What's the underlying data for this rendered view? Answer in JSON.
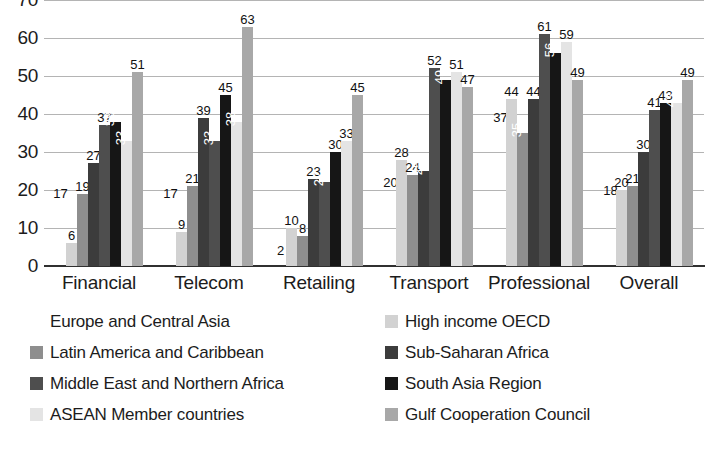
{
  "chart_data": {
    "type": "bar",
    "title": "",
    "subtitle": "",
    "xlabel": "",
    "ylabel": "",
    "ylim": [
      0,
      70
    ],
    "yticks": [
      0,
      10,
      20,
      30,
      40,
      50,
      60,
      70
    ],
    "ytick_labels": [
      "0",
      "10",
      "20",
      "30",
      "40",
      "50",
      "60",
      "70"
    ],
    "grid": true,
    "legend_position": "bottom",
    "categories": [
      "Financial",
      "Telecom",
      "Retailing",
      "Transport",
      "Professional",
      "Overall"
    ],
    "series": [
      {
        "name": "Europe and Central Asia",
        "color": "#ffffff",
        "values": [
          17,
          17,
          2,
          20,
          37,
          18
        ]
      },
      {
        "name": "High income OECD",
        "color": "#d2d2d2",
        "values": [
          6,
          9,
          10,
          28,
          44,
          20
        ]
      },
      {
        "name": "Latin America and Caribbean",
        "color": "#8e8e8e",
        "values": [
          19,
          21,
          8,
          24,
          35,
          21
        ]
      },
      {
        "name": "Sub-Saharan Africa",
        "color": "#3c3c3c",
        "values": [
          27,
          39,
          23,
          25,
          44,
          30
        ]
      },
      {
        "name": "Middle East and Northern Africa",
        "color": "#4e4e4e",
        "values": [
          37,
          33,
          22,
          52,
          61,
          41
        ]
      },
      {
        "name": "South Asia Region",
        "color": "#161616",
        "values": [
          38,
          45,
          30,
          49,
          56,
          43
        ]
      },
      {
        "name": "ASEAN Member countries",
        "color": "#e4e4e4",
        "values": [
          33,
          38,
          33,
          51,
          59,
          43
        ]
      },
      {
        "name": "Gulf Cooperation Council",
        "color": "#a8a8a8",
        "values": [
          51,
          63,
          45,
          47,
          49,
          49
        ]
      }
    ],
    "rotated_labels": [
      [
        false,
        false,
        false,
        false,
        false,
        true,
        true,
        false
      ],
      [
        false,
        false,
        false,
        false,
        true,
        false,
        true,
        false
      ],
      [
        false,
        false,
        false,
        false,
        true,
        false,
        false,
        false
      ],
      [
        false,
        false,
        false,
        true,
        false,
        true,
        false,
        false
      ],
      [
        false,
        false,
        true,
        false,
        false,
        true,
        false,
        false
      ],
      [
        false,
        false,
        false,
        false,
        false,
        false,
        true,
        false
      ]
    ]
  },
  "legend": {
    "items": [
      {
        "label": "Europe and Central Asia",
        "color": "#ffffff",
        "border": "#ffffff"
      },
      {
        "label": "High income OECD",
        "color": "#d2d2d2",
        "border": "#d2d2d2"
      },
      {
        "label": "Latin America and Caribbean",
        "color": "#8e8e8e",
        "border": "#8e8e8e"
      },
      {
        "label": "Sub-Saharan Africa",
        "color": "#3c3c3c",
        "border": "#3c3c3c"
      },
      {
        "label": "Middle East and Northern Africa",
        "color": "#4e4e4e",
        "border": "#4e4e4e"
      },
      {
        "label": "South Asia Region",
        "color": "#161616",
        "border": "#161616"
      },
      {
        "label": "ASEAN Member countries",
        "color": "#e4e4e4",
        "border": "#e4e4e4"
      },
      {
        "label": "Gulf Cooperation Council",
        "color": "#a8a8a8",
        "border": "#a8a8a8"
      }
    ]
  }
}
